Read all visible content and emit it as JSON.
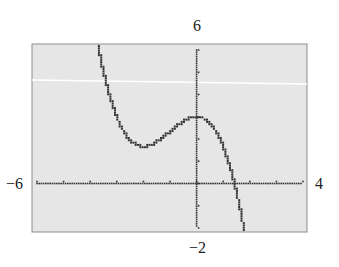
{
  "window": {
    "xmin_label": "−6",
    "xmax_label": "4",
    "ymax_label": "6",
    "ymin_label": "−2"
  },
  "colors": {
    "screen_bg": "#e6e6e6",
    "frame": "#8c8c8c",
    "pixel": "#333333",
    "highlight_line": "#ffffff"
  },
  "chart_data": {
    "type": "line",
    "title": "",
    "xlabel": "",
    "ylabel": "",
    "xlim": [
      -6,
      4
    ],
    "ylim": [
      -2,
      6
    ],
    "xscale": 1,
    "yscale": 1,
    "grid": false,
    "style": "graphing-calculator dot plot",
    "series": [
      {
        "name": "f(x)",
        "x": [
          -3.7,
          -3.5,
          -3.0,
          -2.5,
          -2.0,
          -1.5,
          -1.0,
          -0.5,
          0.0,
          0.5,
          1.0,
          1.37,
          1.5,
          1.78
        ],
        "y": [
          6.19,
          4.96,
          3.0,
          2.04,
          1.67,
          1.88,
          2.33,
          2.79,
          3.0,
          2.71,
          1.67,
          0.0,
          -0.38,
          -2.0
        ]
      }
    ],
    "annotations": {
      "local_min": [
        -2.0,
        1.67
      ],
      "local_max": [
        0.0,
        3.0
      ],
      "x_intercept": 1.37
    }
  }
}
